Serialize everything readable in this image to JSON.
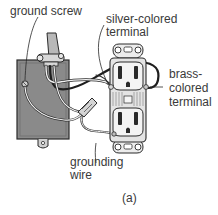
{
  "labels": {
    "ground_screw": "ground screw",
    "silver_line1": "silver-colored",
    "silver_line2": "terminal",
    "brass_line1": "brass-",
    "brass_line2": "colored",
    "brass_line3": "terminal",
    "grounding_line1": "grounding",
    "grounding_line2": "wire",
    "caption": "(a)"
  },
  "colors": {
    "box_fill": "#8a8a8a",
    "outline": "#2a2a2a",
    "outlet_fill": "#e4e4e4",
    "wire_white": "#f2f2f2",
    "wire_black": "#1e1e1e",
    "text": "#3a3a3a"
  }
}
